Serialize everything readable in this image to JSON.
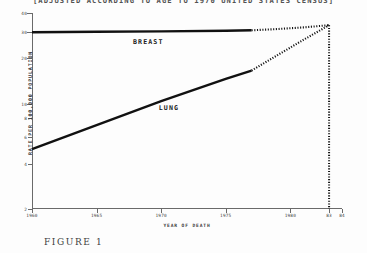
{
  "figure": {
    "title": "[ADJUSTED ACCORDING TO AGE TO 1970 UNITED STATES CENSUS]",
    "caption": "FIGURE 1"
  },
  "chart_data": {
    "type": "line",
    "title": "[ADJUSTED ACCORDING TO AGE TO 1970 UNITED STATES CENSUS]",
    "xlabel": "YEAR OF DEATH",
    "ylabel": "RATE PER 100,000 POPULATION",
    "yscale": "log",
    "ylim": [
      2,
      40
    ],
    "xlim": [
      1960,
      1984
    ],
    "grid": false,
    "legend_position": "inline-annotation",
    "yticks": [
      40,
      30,
      20,
      10,
      8,
      6,
      4,
      2
    ],
    "ytick_labels": [
      "40",
      "30",
      "20",
      "10",
      "8",
      "6",
      "4",
      "2"
    ],
    "xticks": [
      1960,
      1965,
      1970,
      1975,
      1980,
      1983,
      1984
    ],
    "xtick_labels": [
      "1960",
      "1965",
      "1970",
      "1975",
      "1980",
      "83",
      "84"
    ],
    "annotations": [
      {
        "text": "BREAST",
        "x": 1969.0,
        "y": 25.6
      },
      {
        "text": "LUNG",
        "x": 1970.6,
        "y": 9.3
      }
    ],
    "series": [
      {
        "name": "BREAST",
        "style": "solid-then-dotted",
        "observed": {
          "x": [
            1960,
            1965,
            1970,
            1975,
            1977
          ],
          "values": [
            29.8,
            30.0,
            30.2,
            30.5,
            30.7
          ]
        },
        "projected": {
          "x": [
            1977,
            1979,
            1981,
            1983
          ],
          "values": [
            30.7,
            31.3,
            32.1,
            33.2
          ]
        }
      },
      {
        "name": "LUNG",
        "style": "solid-then-dotted",
        "observed": {
          "x": [
            1960,
            1965,
            1970,
            1975,
            1977
          ],
          "values": [
            5.0,
            7.2,
            10.4,
            14.6,
            16.6
          ]
        },
        "projected": {
          "x": [
            1977,
            1979,
            1981,
            1983
          ],
          "values": [
            16.6,
            21.0,
            26.5,
            33.2
          ]
        }
      }
    ],
    "reference_line": {
      "x": 1983,
      "style": "dotted",
      "orientation": "vertical"
    }
  }
}
